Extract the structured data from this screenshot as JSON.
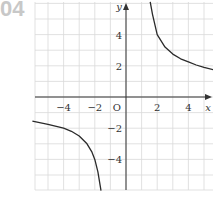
{
  "problem_number": "04",
  "chart_data": {
    "type": "line",
    "title": "",
    "xlabel": "x",
    "ylabel": "y",
    "origin_label": "O",
    "xlim": [
      -6,
      5.8
    ],
    "ylim": [
      -6,
      6
    ],
    "grid": true,
    "grid_step": 1,
    "x_ticks": [
      -4,
      -2,
      2,
      4
    ],
    "x_tick_labels": [
      "−4",
      "−2",
      "2",
      "4"
    ],
    "y_ticks": [
      4,
      2,
      -2,
      -4
    ],
    "y_tick_labels": [
      "4",
      "2",
      "−2",
      "−4"
    ],
    "series": [
      {
        "name": "right-branch",
        "x": [
          1.55,
          1.7,
          2,
          2.5,
          3,
          3.5,
          4,
          4.5,
          5,
          5.6
        ],
        "y": [
          6.1,
          5.3,
          4.0,
          3.2,
          2.75,
          2.45,
          2.25,
          2.05,
          1.9,
          1.75
        ]
      },
      {
        "name": "left-branch",
        "x": [
          -6,
          -5,
          -4,
          -3.5,
          -3,
          -2.5,
          -2.2,
          -2,
          -1.8,
          -1.6
        ],
        "y": [
          -1.55,
          -1.75,
          -2.0,
          -2.2,
          -2.5,
          -3.0,
          -3.5,
          -4.0,
          -4.8,
          -6.0
        ]
      }
    ],
    "asymptotes": {
      "vertical_x": 0,
      "horizontal_y": 0
    }
  },
  "colors": {
    "grid": "#d9d9d9",
    "axis": "#333333",
    "curve": "#2a2a2a",
    "number": "#c8c8c8"
  }
}
